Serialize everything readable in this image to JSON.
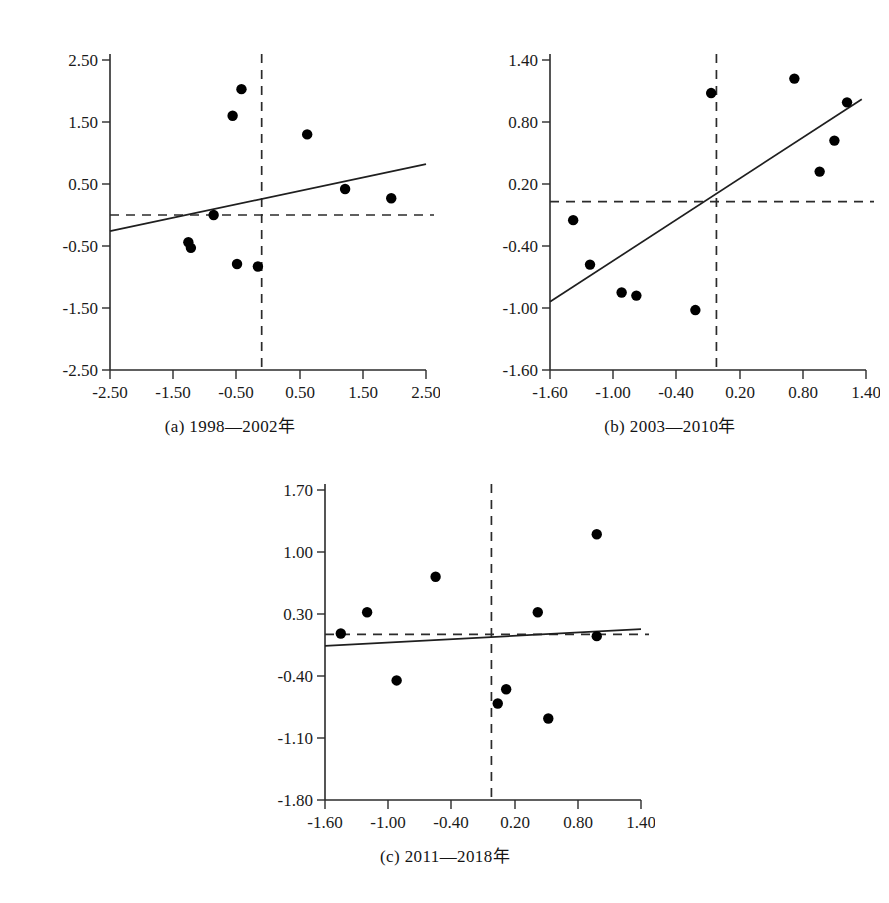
{
  "figure": {
    "background": "#ffffff",
    "point_color": "#000000",
    "axis_color": "#2b2b2b",
    "line_color": "#1f1f1f"
  },
  "panels": [
    {
      "key": "a",
      "caption": "(a)  1998—2002年",
      "chart_data": {
        "type": "scatter",
        "title": "(a)  1998—2002年",
        "xlabel": "",
        "ylabel": "",
        "xlim": [
          -2.5,
          2.5
        ],
        "ylim": [
          -2.5,
          2.5
        ],
        "xticks": [
          -2.5,
          -1.5,
          -0.5,
          0.5,
          1.5,
          2.5
        ],
        "yticks": [
          -2.5,
          -1.5,
          -0.5,
          0.5,
          1.5,
          2.5
        ],
        "xticklabels": [
          "-2.50",
          "-1.50",
          "-0.50",
          "0.50",
          "1.50",
          "2.50"
        ],
        "yticklabels": [
          "-2.50",
          "-1.50",
          "-0.50",
          "0.50",
          "1.50",
          "2.50"
        ],
        "grid": false,
        "legend": "none",
        "points": [
          {
            "x": -0.42,
            "y": 2.03
          },
          {
            "x": -0.56,
            "y": 1.6
          },
          {
            "x": 0.62,
            "y": 1.3
          },
          {
            "x": 1.22,
            "y": 0.42
          },
          {
            "x": 1.95,
            "y": 0.27
          },
          {
            "x": -0.86,
            "y": 0.0
          },
          {
            "x": -1.26,
            "y": -0.44
          },
          {
            "x": -1.22,
            "y": -0.53
          },
          {
            "x": -0.49,
            "y": -0.79
          },
          {
            "x": -0.16,
            "y": -0.83
          }
        ],
        "fit_line": {
          "x0": -2.5,
          "y0": -0.26,
          "x1": 2.5,
          "y1": 0.82
        },
        "reference_lines": {
          "vertical_x": -0.1,
          "horizontal_y": 0.0
        }
      }
    },
    {
      "key": "b",
      "caption": "(b)  2003—2010年",
      "chart_data": {
        "type": "scatter",
        "title": "(b)  2003—2010年",
        "xlabel": "",
        "ylabel": "",
        "xlim": [
          -1.6,
          1.4
        ],
        "ylim": [
          -1.6,
          1.4
        ],
        "xticks": [
          -1.6,
          -1.0,
          -0.4,
          0.2,
          0.8,
          1.4
        ],
        "yticks": [
          -1.6,
          -1.0,
          -0.4,
          0.2,
          0.8,
          1.4
        ],
        "xticklabels": [
          "-1.60",
          "-1.00",
          "-0.40",
          "0.20",
          "0.80",
          "1.40"
        ],
        "yticklabels": [
          "-1.60",
          "-1.00",
          "-0.40",
          "0.20",
          "0.80",
          "1.40"
        ],
        "grid": false,
        "legend": "none",
        "points": [
          {
            "x": -0.07,
            "y": 1.08
          },
          {
            "x": 0.72,
            "y": 1.22
          },
          {
            "x": 1.22,
            "y": 0.99
          },
          {
            "x": 1.1,
            "y": 0.62
          },
          {
            "x": 0.96,
            "y": 0.32
          },
          {
            "x": -1.38,
            "y": -0.15
          },
          {
            "x": -1.22,
            "y": -0.58
          },
          {
            "x": -0.92,
            "y": -0.85
          },
          {
            "x": -0.78,
            "y": -0.88
          },
          {
            "x": -0.22,
            "y": -1.02
          }
        ],
        "fit_line": {
          "x0": -1.6,
          "y0": -0.94,
          "x1": 1.36,
          "y1": 1.02
        },
        "reference_lines": {
          "vertical_x": -0.02,
          "horizontal_y": 0.03
        }
      }
    },
    {
      "key": "c",
      "caption": "(c)  2011—2018年",
      "chart_data": {
        "type": "scatter",
        "title": "(c)  2011—2018年",
        "xlabel": "",
        "ylabel": "",
        "xlim": [
          -1.6,
          1.4
        ],
        "ylim": [
          -1.8,
          1.7
        ],
        "xticks": [
          -1.6,
          -1.0,
          -0.4,
          0.2,
          0.8,
          1.4
        ],
        "yticks": [
          -1.8,
          -1.1,
          -0.4,
          0.3,
          1.0,
          1.7
        ],
        "xticklabels": [
          "-1.60",
          "-1.00",
          "-0.40",
          "0.20",
          "0.80",
          "1.40"
        ],
        "yticklabels": [
          "-1.80",
          "-1.10",
          "-0.40",
          "0.30",
          "1.00",
          "1.70"
        ],
        "grid": false,
        "legend": "none",
        "points": [
          {
            "x": 0.98,
            "y": 1.2
          },
          {
            "x": -0.55,
            "y": 0.72
          },
          {
            "x": -1.2,
            "y": 0.32
          },
          {
            "x": 0.42,
            "y": 0.32
          },
          {
            "x": -1.45,
            "y": 0.08
          },
          {
            "x": 0.98,
            "y": 0.05
          },
          {
            "x": -0.92,
            "y": -0.45
          },
          {
            "x": 0.12,
            "y": -0.55
          },
          {
            "x": 0.04,
            "y": -0.71
          },
          {
            "x": 0.52,
            "y": -0.88
          }
        ],
        "fit_line": {
          "x0": -1.6,
          "y0": -0.06,
          "x1": 1.4,
          "y1": 0.13
        },
        "reference_lines": {
          "vertical_x": -0.02,
          "horizontal_y": 0.07
        }
      }
    }
  ]
}
